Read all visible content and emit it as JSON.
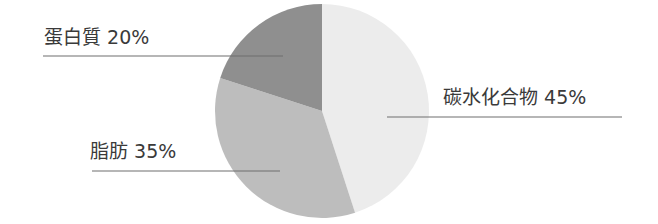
{
  "chart_data": {
    "type": "pie",
    "title": "",
    "categories": [
      "碳水化合物",
      "脂肪",
      "蛋白質"
    ],
    "values": [
      45,
      35,
      20
    ],
    "unit": "%",
    "start_angle_deg": 0,
    "direction": "clockwise",
    "colors": [
      "#ececec",
      "#bdbdbd",
      "#8f8f8f"
    ],
    "labels": [
      {
        "name": "碳水化合物",
        "value": "45%",
        "text": "碳水化合物 45%"
      },
      {
        "name": "脂肪",
        "value": "35%",
        "text": "脂肪 35%"
      },
      {
        "name": "蛋白質",
        "value": "20%",
        "text": "蛋白質 20%"
      }
    ],
    "legend": "none (direct labels with leader lines)",
    "grid": false
  },
  "labels": {
    "carbs": "碳水化合物 45%",
    "fat": "脂肪 35%",
    "protein": "蛋白質 20%"
  }
}
